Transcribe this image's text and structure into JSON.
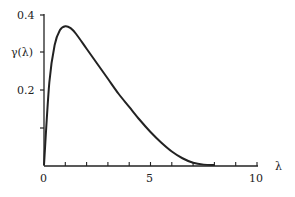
{
  "chart_data": {
    "type": "line",
    "title": "",
    "xlabel": "λ",
    "ylabel": "γ(λ)",
    "xlim": [
      0,
      10
    ],
    "ylim": [
      0,
      0.4
    ],
    "x_ticks": [
      "0",
      "5",
      "10"
    ],
    "y_ticks": [
      "0.2",
      "0.4"
    ],
    "grid": false,
    "series": [
      {
        "name": "γ(λ)",
        "x": [
          0,
          0.25,
          0.5,
          0.75,
          1.0,
          1.25,
          1.5,
          2.0,
          2.5,
          3.0,
          3.5,
          4.0,
          4.5,
          5.0,
          5.5,
          6.0,
          6.5,
          7.0,
          7.5,
          8.0
        ],
        "values": [
          0.0,
          0.22,
          0.32,
          0.36,
          0.37,
          0.365,
          0.35,
          0.31,
          0.27,
          0.23,
          0.19,
          0.155,
          0.12,
          0.088,
          0.06,
          0.036,
          0.018,
          0.006,
          0.001,
          0.0
        ]
      }
    ]
  }
}
